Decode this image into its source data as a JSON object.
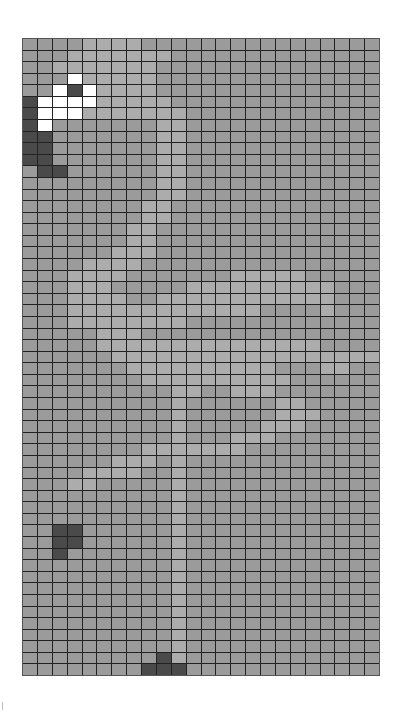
{
  "board": {
    "cols": 24,
    "rows": 55,
    "legend": {
      ".": "unrevealed-grey",
      "l": "light-grey-path",
      "w": "white-revealed",
      "d": "dark-cell"
    },
    "colors": {
      "base": "#9b9b9b",
      "light": "#acacac",
      "white": "#ffffff",
      "dark": "#4a4a4a",
      "grid_line": "#222222"
    },
    "cells": [
      "....llll................",
      "...lllllll..............",
      "..lllllll...............",
      "...wlllll...............",
      "..wdwllll...............",
      "dwwwwlllll..............",
      "dwwwlllllll.............",
      "dw.......ll.............",
      "dd.......ll.............",
      "dd.......ll.............",
      "dd.......ll.............",
      ".dd......ll.............",
      ".........ll.............",
      ".........ll.............",
      "........ll..............",
      "........ll..............",
      ".......ll...............",
      ".......ll...............",
      "......lll...............",
      "....llll................",
      "...llll.......lllll.....",
      "...lll.....llllllllll...",
      "...llll..llllllllllll...",
      "...lllllllllllll....l...",
      "...llllllll.............",
      ".....lll................",
      ".....lllllllllllllll....",
      "......llllllllllllllllll",
      ".......llllllllll...ll..",
      "........llllllllll......",
      "..........ll..lll.......",
      "..........l......ll.....",
      "..........l......lll....",
      "..........l.....lll.....",
      "..........l...lll.......",
      "........lllllll.........",
      "......lll.l.............",
      "....llll..l.............",
      "...ll.....l.............",
      "..........l.............",
      "..........l.............",
      "..........l.............",
      "..dd......l.............",
      "..dd......l.............",
      "..d.......l.............",
      "..........l.............",
      "..........l.............",
      "..........l.............",
      "..........l.............",
      "..........l.............",
      "..........l.............",
      "..........l.............",
      "..........l.............",
      ".........dl.............",
      "........ddd............."
    ]
  }
}
